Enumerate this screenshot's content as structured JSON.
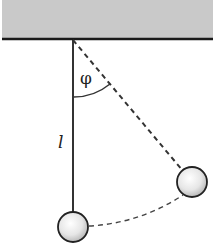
{
  "diagram": {
    "type": "pendulum",
    "labels": {
      "angle": "φ",
      "length": "l"
    },
    "colors": {
      "ceiling_fill": "#c9c9c9",
      "ceiling_edge": "#1a1a1a",
      "string": "#333333",
      "dashed": "#333333",
      "bob_stroke": "#222222",
      "bob_fill_light": "#ffffff",
      "bob_fill_dark": "#bdbdbd"
    },
    "elements": {
      "ceiling": "fixed support",
      "string": "pendulum string at rest (vertical)",
      "displaced_string": "dashed line to displaced bob",
      "bob_rest": "bob at equilibrium",
      "bob_displaced": "bob displaced by angle φ",
      "trajectory": "dashed arc path of bob"
    }
  }
}
